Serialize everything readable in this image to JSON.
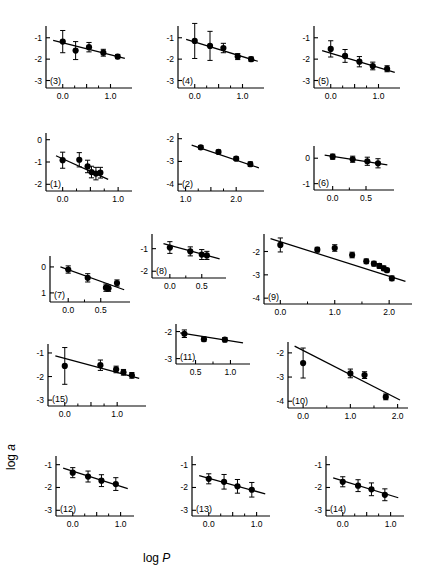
{
  "figure": {
    "axis_labels": {
      "y": "log a",
      "x": "log P"
    }
  },
  "chart_data": [
    {
      "type": "scatter",
      "id": "(3)",
      "title": "",
      "xlabel": "",
      "ylabel": "",
      "xlim": [
        -0.35,
        1.45
      ],
      "ylim": [
        -3.35,
        -0.45
      ],
      "xticks": [
        0.0,
        0.5,
        1.0
      ],
      "xticklabels": [
        "0.0",
        "",
        "1.0"
      ],
      "yticks": [
        -1,
        -2,
        -3
      ],
      "yticklabels": [
        "-1",
        "-2",
        "-3"
      ],
      "grid": false,
      "legend": null,
      "x": [
        0.0,
        0.27,
        0.55,
        0.85,
        1.15
      ],
      "y": [
        -1.18,
        -1.6,
        -1.44,
        -1.7,
        -1.88
      ],
      "yerr": [
        0.52,
        0.42,
        0.22,
        0.16,
        0.1
      ],
      "fit": {
        "x": [
          -0.2,
          1.3
        ],
        "y": [
          -1.12,
          -1.96
        ]
      }
    },
    {
      "type": "scatter",
      "id": "(4)",
      "xlim": [
        -0.35,
        1.45
      ],
      "ylim": [
        -3.35,
        -0.45
      ],
      "xticks": [
        0.0,
        0.5,
        1.0
      ],
      "xticklabels": [
        "0.0",
        "",
        "1.0"
      ],
      "yticks": [
        -1,
        -2,
        -3
      ],
      "yticklabels": [
        "-1",
        "-2",
        "-3"
      ],
      "grid": false,
      "x": [
        0.0,
        0.32,
        0.6,
        0.9,
        1.18
      ],
      "y": [
        -1.15,
        -1.38,
        -1.48,
        -1.88,
        -2.0
      ],
      "yerr": [
        0.82,
        0.68,
        0.22,
        0.14,
        0.1
      ],
      "fit": {
        "x": [
          -0.18,
          1.32
        ],
        "y": [
          -1.08,
          -2.1
        ]
      }
    },
    {
      "type": "scatter",
      "id": "(5)",
      "xlim": [
        -0.35,
        1.45
      ],
      "ylim": [
        -3.35,
        -0.45
      ],
      "xticks": [
        0.0,
        0.5,
        1.0
      ],
      "xticklabels": [
        "0.0",
        "",
        "1.0"
      ],
      "yticks": [
        -1,
        -2,
        -3
      ],
      "yticklabels": [
        "-1",
        "-2",
        "-3"
      ],
      "grid": false,
      "x": [
        0.0,
        0.3,
        0.6,
        0.88,
        1.18
      ],
      "y": [
        -1.52,
        -1.85,
        -2.12,
        -2.32,
        -2.45
      ],
      "yerr": [
        0.38,
        0.3,
        0.24,
        0.18,
        0.14
      ],
      "fit": {
        "x": [
          -0.18,
          1.34
        ],
        "y": [
          -1.6,
          -2.62
        ]
      }
    },
    {
      "type": "scatter",
      "id": "(1)",
      "xlim": [
        -0.3,
        1.25
      ],
      "ylim": [
        -2.3,
        0.3
      ],
      "xticks": [
        0.0,
        0.5,
        1.0
      ],
      "xticklabels": [
        "0.0",
        "",
        "1.0"
      ],
      "yticks": [
        0,
        -1,
        -2
      ],
      "yticklabels": [
        "0",
        "-1",
        "-2"
      ],
      "grid": false,
      "x": [
        0.0,
        0.3,
        0.45,
        0.52,
        0.6,
        0.68
      ],
      "y": [
        -0.92,
        -0.9,
        -1.2,
        -1.45,
        -1.52,
        -1.48
      ],
      "yerr": [
        0.36,
        0.32,
        0.28,
        0.26,
        0.28,
        0.24
      ],
      "fit": {
        "x": [
          -0.12,
          0.82
        ],
        "y": [
          -0.72,
          -1.78
        ]
      }
    },
    {
      "type": "scatter",
      "id": "(2)",
      "xlim": [
        0.85,
        2.55
      ],
      "ylim": [
        -4.3,
        -1.75
      ],
      "xticks": [
        1.0,
        1.5,
        2.0
      ],
      "xticklabels": [
        "1.0",
        "",
        "2.0"
      ],
      "yticks": [
        -2,
        -3,
        -4
      ],
      "yticklabels": [
        "-2",
        "-3",
        "-4"
      ],
      "grid": false,
      "x": [
        1.3,
        1.65,
        2.0,
        2.28
      ],
      "y": [
        -2.38,
        -2.58,
        -2.88,
        -3.12
      ],
      "yerr": [
        0.08,
        0.08,
        0.08,
        0.1
      ],
      "fit": {
        "x": [
          1.12,
          2.45
        ],
        "y": [
          -2.28,
          -3.28
        ]
      }
    },
    {
      "type": "scatter",
      "id": "(6)",
      "xlim": [
        -0.28,
        0.92
      ],
      "ylim": [
        -1.25,
        0.48
      ],
      "xticks": [
        0.0,
        0.5
      ],
      "xticklabels": [
        "0.0",
        "0.5"
      ],
      "yticks": [
        0,
        -1
      ],
      "yticklabels": [
        "0",
        "-1"
      ],
      "grid": false,
      "x": [
        0.0,
        0.3,
        0.52,
        0.68
      ],
      "y": [
        0.06,
        -0.04,
        -0.12,
        -0.2
      ],
      "yerr": [
        0.1,
        0.12,
        0.16,
        0.18
      ],
      "fit": {
        "x": [
          -0.12,
          0.82
        ],
        "y": [
          0.12,
          -0.26
        ]
      }
    },
    {
      "type": "scatter",
      "id": "(7)",
      "xlim": [
        -0.28,
        0.95
      ],
      "ylim": [
        -1.35,
        0.42
      ],
      "xticks": [
        0.0,
        0.5
      ],
      "xticklabels": [
        "0.0",
        "0.5"
      ],
      "yticks": [
        0,
        -1
      ],
      "yticklabels": [
        "0",
        "1"
      ],
      "grid": false,
      "x": [
        0.0,
        0.3,
        0.58,
        0.62,
        0.75
      ],
      "y": [
        -0.1,
        -0.42,
        -0.8,
        -0.82,
        -0.62
      ],
      "yerr": [
        0.14,
        0.16,
        0.14,
        0.12,
        0.12
      ],
      "fit": {
        "x": [
          -0.12,
          0.86
        ],
        "y": [
          0.0,
          -0.88
        ]
      }
    },
    {
      "type": "scatter",
      "id": "(8)",
      "xlim": [
        -0.28,
        0.88
      ],
      "ylim": [
        -2.3,
        -0.35
      ],
      "xticks": [
        0.0,
        0.5
      ],
      "xticklabels": [
        "0.0",
        "0.5"
      ],
      "yticks": [
        -1,
        -2
      ],
      "yticklabels": [
        "-1",
        "-2"
      ],
      "grid": false,
      "x": [
        0.0,
        0.32,
        0.5,
        0.58
      ],
      "y": [
        -0.95,
        -1.12,
        -1.26,
        -1.3
      ],
      "yerr": [
        0.26,
        0.2,
        0.22,
        0.18
      ],
      "fit": {
        "x": [
          -0.1,
          0.78
        ],
        "y": [
          -0.78,
          -1.45
        ]
      }
    },
    {
      "type": "scatter",
      "id": "(9)",
      "xlim": [
        -0.3,
        2.42
      ],
      "ylim": [
        -4.25,
        -1.25
      ],
      "xticks": [
        0.0,
        1.0,
        2.0
      ],
      "xticklabels": [
        "0.0",
        "1.0",
        "2.0"
      ],
      "yticks": [
        -2,
        -3,
        -4
      ],
      "yticklabels": [
        "-2",
        "-3",
        "-4"
      ],
      "grid": false,
      "x": [
        0.0,
        0.68,
        1.0,
        1.32,
        1.58,
        1.72,
        1.82,
        1.9,
        1.96,
        2.05
      ],
      "y": [
        -1.72,
        -1.92,
        -1.85,
        -2.15,
        -2.42,
        -2.52,
        -2.62,
        -2.72,
        -2.8,
        -3.15
      ],
      "yerr": [
        0.3,
        0.1,
        0.14,
        0.12,
        0.1,
        0.1,
        0.1,
        0.1,
        0.08,
        0.1
      ],
      "fit": {
        "x": [
          -0.18,
          2.3
        ],
        "y": [
          -1.45,
          -3.28
        ]
      }
    },
    {
      "type": "scatter",
      "id": "(15)",
      "xlim": [
        -0.32,
        1.55
      ],
      "ylim": [
        -3.25,
        -0.62
      ],
      "xticks": [
        0.0,
        0.5,
        1.0
      ],
      "xticklabels": [
        "0.0",
        "",
        "1.0"
      ],
      "yticks": [
        -1,
        -2,
        -3
      ],
      "yticklabels": [
        "-1",
        "-2",
        "-3"
      ],
      "grid": false,
      "x": [
        0.0,
        0.68,
        0.98,
        1.12,
        1.28
      ],
      "y": [
        -1.55,
        -1.52,
        -1.7,
        -1.82,
        -1.95
      ],
      "yerr": [
        0.78,
        0.22,
        0.14,
        0.12,
        0.12
      ],
      "fit": {
        "x": [
          -0.18,
          1.42
        ],
        "y": [
          -1.12,
          -2.08
        ]
      }
    },
    {
      "type": "scatter",
      "id": "(11)",
      "xlim": [
        0.22,
        1.28
      ],
      "ylim": [
        -3.2,
        -1.72
      ],
      "xticks": [
        0.5,
        1.0
      ],
      "xticklabels": [
        "0.5",
        "1.0"
      ],
      "yticks": [
        -2,
        -3
      ],
      "yticklabels": [
        "-2",
        "-3"
      ],
      "grid": false,
      "x": [
        0.34,
        0.62,
        0.92
      ],
      "y": [
        -2.08,
        -2.28,
        -2.3
      ],
      "yerr": [
        0.14,
        0.08,
        0.08
      ],
      "fit": {
        "x": [
          0.28,
          1.18
        ],
        "y": [
          -2.05,
          -2.42
        ]
      }
    },
    {
      "type": "scatter",
      "id": "(10)",
      "xlim": [
        -0.32,
        2.22
      ],
      "ylim": [
        -4.28,
        -1.55
      ],
      "xticks": [
        0.0,
        1.0,
        2.0
      ],
      "xticklabels": [
        "0.0",
        "1.0",
        "2.0"
      ],
      "yticks": [
        -2,
        -3,
        -4
      ],
      "yticklabels": [
        "-2",
        "-3",
        "-4"
      ],
      "grid": false,
      "x": [
        0.0,
        1.0,
        1.3,
        1.75
      ],
      "y": [
        -2.42,
        -2.85,
        -2.92,
        -3.82
      ],
      "yerr": [
        0.62,
        0.18,
        0.14,
        0.12
      ],
      "fit": {
        "x": [
          -0.18,
          2.05
        ],
        "y": [
          -1.72,
          -3.95
        ]
      }
    },
    {
      "type": "scatter",
      "id": "(12)",
      "xlim": [
        -0.35,
        1.28
      ],
      "ylim": [
        -3.25,
        -0.62
      ],
      "xticks": [
        0.0,
        0.5,
        1.0
      ],
      "xticklabels": [
        "0.0",
        "",
        "1.0"
      ],
      "yticks": [
        -1,
        -2,
        -3
      ],
      "yticklabels": [
        "-1",
        "-2",
        "-3"
      ],
      "grid": false,
      "x": [
        0.0,
        0.32,
        0.6,
        0.9
      ],
      "y": [
        -1.35,
        -1.52,
        -1.7,
        -1.85
      ],
      "yerr": [
        0.22,
        0.24,
        0.26,
        0.28
      ],
      "fit": {
        "x": [
          -0.2,
          1.15
        ],
        "y": [
          -1.15,
          -2.05
        ]
      }
    },
    {
      "type": "scatter",
      "id": "(13)",
      "xlim": [
        -0.35,
        1.28
      ],
      "ylim": [
        -3.25,
        -0.62
      ],
      "xticks": [
        0.0,
        0.5,
        1.0
      ],
      "xticklabels": [
        "0.0",
        "",
        "1.0"
      ],
      "yticks": [
        -1,
        -2,
        -3
      ],
      "yticklabels": [
        "-1",
        "-2",
        "-3"
      ],
      "grid": false,
      "x": [
        0.0,
        0.32,
        0.6,
        0.9
      ],
      "y": [
        -1.62,
        -1.75,
        -1.95,
        -2.1
      ],
      "yerr": [
        0.22,
        0.32,
        0.3,
        0.32
      ],
      "fit": {
        "x": [
          -0.2,
          1.18
        ],
        "y": [
          -1.48,
          -2.28
        ]
      }
    },
    {
      "type": "scatter",
      "id": "(14)",
      "xlim": [
        -0.35,
        1.28
      ],
      "ylim": [
        -3.25,
        -0.62
      ],
      "xticks": [
        0.0,
        0.5,
        1.0
      ],
      "xticklabels": [
        "0.0",
        "",
        "1.0"
      ],
      "yticks": [
        -1,
        -2,
        -3
      ],
      "yticklabels": [
        "-1",
        "-2",
        "-3"
      ],
      "grid": false,
      "x": [
        0.0,
        0.32,
        0.6,
        0.88
      ],
      "y": [
        -1.75,
        -1.92,
        -2.08,
        -2.32
      ],
      "yerr": [
        0.22,
        0.26,
        0.28,
        0.26
      ],
      "fit": {
        "x": [
          -0.2,
          1.16
        ],
        "y": [
          -1.58,
          -2.45
        ]
      }
    }
  ],
  "panel_layout": [
    {
      "id": "(3)",
      "left": 20,
      "top": 18,
      "w": 118,
      "h": 92,
      "pl": 26,
      "pr": 6,
      "pt": 8,
      "pb": 22
    },
    {
      "id": "(4)",
      "left": 152,
      "top": 18,
      "w": 118,
      "h": 92,
      "pl": 26,
      "pr": 6,
      "pt": 8,
      "pb": 22
    },
    {
      "id": "(5)",
      "left": 288,
      "top": 18,
      "w": 118,
      "h": 92,
      "pl": 26,
      "pr": 6,
      "pt": 8,
      "pb": 22
    },
    {
      "id": "(1)",
      "left": 20,
      "top": 125,
      "w": 118,
      "h": 88,
      "pl": 26,
      "pr": 6,
      "pt": 8,
      "pb": 22
    },
    {
      "id": "(2)",
      "left": 152,
      "top": 125,
      "w": 118,
      "h": 88,
      "pl": 26,
      "pr": 6,
      "pt": 8,
      "pb": 22
    },
    {
      "id": "(6)",
      "left": 288,
      "top": 138,
      "w": 112,
      "h": 74,
      "pl": 26,
      "pr": 6,
      "pt": 8,
      "pb": 22
    },
    {
      "id": "(7)",
      "left": 26,
      "top": 250,
      "w": 110,
      "h": 74,
      "pl": 24,
      "pr": 6,
      "pt": 6,
      "pb": 22
    },
    {
      "id": "(8)",
      "left": 128,
      "top": 228,
      "w": 104,
      "h": 72,
      "pl": 24,
      "pr": 6,
      "pt": 6,
      "pb": 22
    },
    {
      "id": "(9)",
      "left": 238,
      "top": 226,
      "w": 180,
      "h": 100,
      "pl": 26,
      "pr": 6,
      "pt": 8,
      "pb": 22
    },
    {
      "id": "(15)",
      "left": 22,
      "top": 336,
      "w": 130,
      "h": 92,
      "pl": 26,
      "pr": 6,
      "pt": 8,
      "pb": 22
    },
    {
      "id": "(11)",
      "left": 152,
      "top": 318,
      "w": 104,
      "h": 68,
      "pl": 24,
      "pr": 6,
      "pt": 6,
      "pb": 22
    },
    {
      "id": "(10)",
      "left": 262,
      "top": 334,
      "w": 152,
      "h": 96,
      "pl": 26,
      "pr": 6,
      "pt": 8,
      "pb": 22
    },
    {
      "id": "(12)",
      "left": 30,
      "top": 448,
      "w": 110,
      "h": 90,
      "pl": 26,
      "pr": 6,
      "pt": 8,
      "pb": 22
    },
    {
      "id": "(13)",
      "left": 166,
      "top": 448,
      "w": 110,
      "h": 90,
      "pl": 26,
      "pr": 6,
      "pt": 8,
      "pb": 22
    },
    {
      "id": "(14)",
      "left": 300,
      "top": 448,
      "w": 110,
      "h": 90,
      "pl": 26,
      "pr": 6,
      "pt": 8,
      "pb": 22
    }
  ],
  "style": {
    "ink": "#000000",
    "marker_radius": 3.1,
    "line_width": 1.25
  }
}
